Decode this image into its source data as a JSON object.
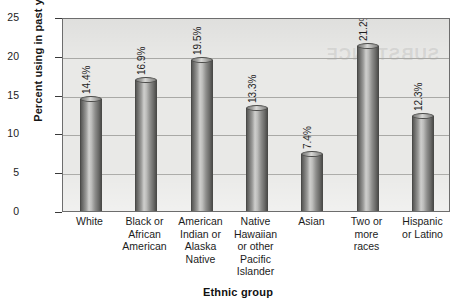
{
  "chart_data": {
    "type": "bar",
    "title": "",
    "xlabel": "Ethnic group",
    "ylabel": "Percent using in past year",
    "ylim": [
      0,
      25
    ],
    "ytick_labels": [
      "25",
      "20",
      "15",
      "10",
      "5",
      "0"
    ],
    "ytick_values": [
      25,
      20,
      15,
      10,
      5,
      0
    ],
    "grid": true,
    "legend": "none",
    "categories": [
      "White",
      "Black or African American",
      "American Indian or Alaska Native",
      "Native Hawaiian or other Pacific Islander",
      "Asian",
      "Two or more races",
      "Hispanic or Latino"
    ],
    "category_lines": [
      [
        "White"
      ],
      [
        "Black or",
        "African",
        "American"
      ],
      [
        "American",
        "Indian or",
        "Alaska",
        "Native"
      ],
      [
        "Native",
        "Hawaiian",
        "or other",
        "Pacific",
        "Islander"
      ],
      [
        "Asian"
      ],
      [
        "Two or",
        "more",
        "races"
      ],
      [
        "Hispanic",
        "or Latino"
      ]
    ],
    "values": [
      14.4,
      16.9,
      19.5,
      13.3,
      7.4,
      21.2,
      12.3
    ],
    "value_labels": [
      "14.4%",
      "16.9%",
      "19.5%",
      "13.3%",
      "7.4%",
      "21.2%",
      "12.3%"
    ]
  },
  "ghost_text": "SUBSTANCE",
  "colors": {
    "plot_background": "#e9e9e7",
    "bar_dark": "#4e4e4c",
    "bar_light": "#cfcfcd",
    "gridline": "#a9a9a6",
    "axis": "#3a3a3a",
    "text": "#1c1c1c",
    "page_background": "#ffffff"
  }
}
